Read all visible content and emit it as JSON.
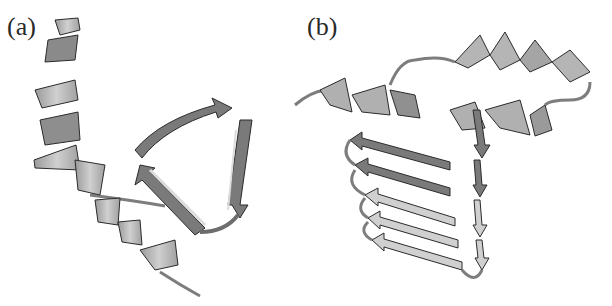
{
  "figure": {
    "panels": [
      {
        "label": "(a)",
        "description": "Protein ribbon: long alpha-helix beside a three-stranded beta-sheet forming a triangular loop"
      },
      {
        "label": "(b)",
        "description": "Protein ribbon: beta-helix (stacked beta strands) capped by alpha helices"
      }
    ],
    "colors": {
      "helix_light": "#bdbdbd",
      "helix_dark": "#8a8a8a",
      "strand_dark": "#7a7a7a",
      "strand_light": "#d4d4d4",
      "outline": "#2b2b2b",
      "coil": "#7d7d7d"
    }
  }
}
